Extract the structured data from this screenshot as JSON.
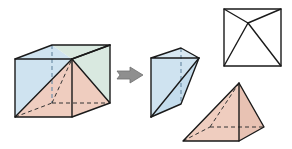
{
  "diagram": {
    "description": "A cube decomposed into a triangular prism and a square pyramid",
    "colors": {
      "background": "#ffffff",
      "blue_face": "#cfe3f0",
      "green_face": "#d9e9e0",
      "pink_face": "#efcdbf",
      "top_view_fill": "#dbe8e0",
      "arrow_fill": "#8f8f8f",
      "edge": "#1a1a1a"
    },
    "elements": [
      {
        "id": "cube",
        "label": "cube with diagonal cut"
      },
      {
        "id": "arrow",
        "label": "arrow"
      },
      {
        "id": "prism",
        "label": "triangular prism piece"
      },
      {
        "id": "top-view",
        "label": "top view of cube"
      },
      {
        "id": "pyramid",
        "label": "square pyramid piece"
      }
    ]
  }
}
